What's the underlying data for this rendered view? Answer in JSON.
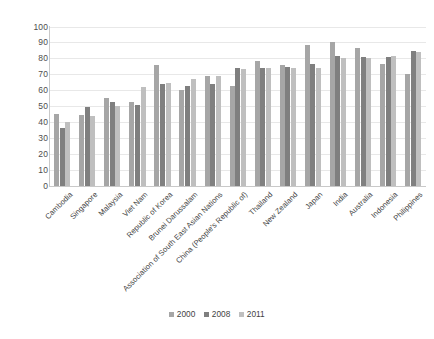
{
  "chart_data": {
    "type": "bar",
    "title": "",
    "xlabel": "",
    "ylabel": "",
    "ylim": [
      0,
      100
    ],
    "yticks": [
      0,
      10,
      20,
      30,
      40,
      50,
      60,
      70,
      80,
      90,
      100
    ],
    "grid": true,
    "legend_position": "bottom",
    "categories": [
      "Cambodia",
      "Singapore",
      "Malaysia",
      "Viet Nam",
      "Republic of Korea",
      "Brunei Darussalam",
      "Association of South East Asian Nations",
      "China (People's Republic of)",
      "Thailand",
      "New Zealand",
      "Japan",
      "India",
      "Australia",
      "Indonesia",
      "Philippines"
    ],
    "series": [
      {
        "name": "2000",
        "color": "#a6a6a6",
        "values": [
          45,
          44.5,
          55.5,
          53,
          76,
          60.5,
          69.5,
          63,
          78.5,
          76,
          89,
          90.5,
          86.5,
          77,
          70.5
        ]
      },
      {
        "name": "2008",
        "color": "#7f7f7f",
        "values": [
          36.5,
          50,
          53,
          51,
          64,
          63,
          64,
          74.5,
          74.5,
          75,
          77,
          81.5,
          81,
          81,
          85
        ]
      },
      {
        "name": "2011",
        "color": "#bfbfbf",
        "values": [
          40.5,
          44,
          50.5,
          62,
          65,
          67,
          69,
          73.5,
          74,
          74.5,
          74.5,
          80.5,
          80.5,
          82,
          84
        ]
      }
    ]
  },
  "legend": {
    "items": [
      {
        "label": "2000"
      },
      {
        "label": "2008"
      },
      {
        "label": "2011"
      }
    ]
  }
}
